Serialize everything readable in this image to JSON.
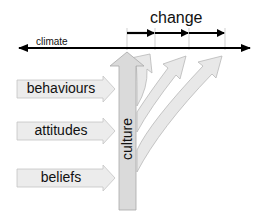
{
  "diagram": {
    "change_label": "change",
    "climate_label": "climate",
    "culture_label": "culture",
    "inputs": [
      {
        "label": "behaviours"
      },
      {
        "label": "attitudes"
      },
      {
        "label": "beliefs"
      }
    ],
    "colors": {
      "arrow_fill": "#e6e6e6",
      "arrow_stroke": "#b5b5b5",
      "culture_fill": "#d6d6d6",
      "line": "#000000"
    }
  }
}
